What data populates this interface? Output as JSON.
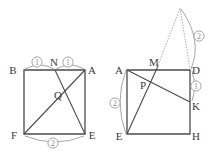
{
  "figure": {
    "background_color": "#ffffff",
    "stroke_color": "#4a4a4a",
    "annotation_color": "#9b9b9b",
    "label_color": "#3a3a3a",
    "left_diagram": {
      "name": "square-BAEF",
      "vertices": [
        {
          "label": "B",
          "x": 24,
          "y": 70,
          "text_x": 13,
          "text_y": 74
        },
        {
          "label": "A",
          "x": 85,
          "y": 70,
          "text_x": 88,
          "text_y": 74
        },
        {
          "label": "E",
          "x": 85,
          "y": 134,
          "text_x": 88,
          "text_y": 139
        },
        {
          "label": "F",
          "x": 24,
          "y": 134,
          "text_x": 12,
          "text_y": 139
        }
      ],
      "points": [
        {
          "label": "N",
          "x": 55,
          "y": 70,
          "text_x": 52,
          "text_y": 66
        },
        {
          "label": "Q",
          "x": 62,
          "y": 94,
          "text_x": 56,
          "text_y": 99
        }
      ],
      "segments": [
        {
          "name": "segment-N-E",
          "x1": 55,
          "y1": 70,
          "x2": 85,
          "y2": 134
        },
        {
          "name": "segment-A-F",
          "x1": 85,
          "y1": 70,
          "x2": 24,
          "y2": 134
        }
      ],
      "measure_arcs": [
        {
          "name": "arc-BN",
          "label": "1",
          "path": "M 25 69 Q 40 61 54 69",
          "label_x": 37,
          "label_y": 64
        },
        {
          "name": "arc-NA",
          "label": "1",
          "path": "M 56 69 Q 70 61 84 69",
          "label_x": 68,
          "label_y": 64
        },
        {
          "name": "arc-FE",
          "label": "2",
          "path": "M 25 136 Q 55 148 84 136",
          "label_x": 53,
          "label_y": 146
        }
      ]
    },
    "right_diagram": {
      "name": "square-ADHE",
      "vertices": [
        {
          "label": "A",
          "x": 127,
          "y": 70,
          "text_x": 117,
          "text_y": 74
        },
        {
          "label": "D",
          "x": 190,
          "y": 70,
          "text_x": 193,
          "text_y": 74
        },
        {
          "label": "H",
          "x": 190,
          "y": 134,
          "text_x": 193,
          "text_y": 139
        },
        {
          "label": "E",
          "x": 127,
          "y": 134,
          "text_x": 116,
          "text_y": 139
        }
      ],
      "points": [
        {
          "label": "M",
          "x": 155,
          "y": 70,
          "text_x": 151,
          "text_y": 66
        },
        {
          "label": "K",
          "x": 190,
          "y": 102,
          "text_x": 193,
          "text_y": 109
        },
        {
          "label": "P",
          "x": 149,
          "y": 85,
          "text_x": 141,
          "text_y": 89
        }
      ],
      "segments": [
        {
          "name": "segment-A-K",
          "x1": 127,
          "y1": 70,
          "x2": 190,
          "y2": 102
        },
        {
          "name": "segment-E-M",
          "x1": 127,
          "y1": 134,
          "x2": 158,
          "y2": 66
        }
      ],
      "dotted_segments": [
        {
          "name": "dotted-segment-M-apex",
          "x1": 157,
          "y1": 68,
          "x2": 180,
          "y2": 8
        },
        {
          "name": "dotted-segment-apex-D",
          "x1": 180,
          "y1": 8,
          "x2": 190,
          "y2": 69
        }
      ],
      "apex": {
        "name": "apex-point",
        "x": 180,
        "y": 8
      },
      "measure_arcs": [
        {
          "name": "arc-AE",
          "label": "2",
          "path": "M 126 70 Q 114 102 126 134",
          "label_x": 115,
          "label_y": 106
        },
        {
          "name": "arc-DK",
          "label": "1",
          "path": "M 191 71 Q 196 86 191 101",
          "label_x": 194,
          "label_y": 89
        },
        {
          "name": "arc-apex-D",
          "label": "2",
          "path": "M 181 9 Q 201 40 191 69",
          "label_x": 197,
          "label_y": 38
        }
      ]
    }
  }
}
